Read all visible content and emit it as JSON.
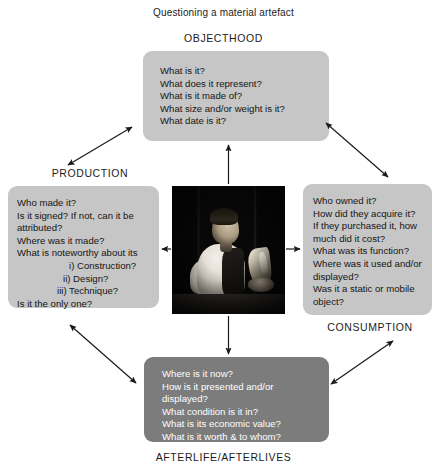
{
  "diagram": {
    "title": "Questioning a material artefact",
    "centre_image_alt": "photograph of a person examining an object",
    "colors": {
      "box_light": "#c6c6c6",
      "box_dark": "#7c7c7c",
      "text_dark": "#151515",
      "text_light": "#ffffff",
      "arrow": "#1a1a1a",
      "background": "#ffffff"
    },
    "nodes": {
      "objecthood": {
        "label": "OBJECTHOOD",
        "questions": [
          "What is it?",
          "What does it represent?",
          "What is it made of?",
          "What size and/or weight is it?",
          "What date is it?"
        ]
      },
      "production": {
        "label": "PRODUCTION",
        "questions": [
          "Who made it?",
          "Is it signed? If not, can it be",
          "attributed?",
          "Where was it made?",
          "What is noteworthy about its",
          "i) Construction?",
          "ii) Design?",
          "iii) Technique?",
          "Is it the only one?"
        ]
      },
      "consumption": {
        "label": "CONSUMPTION",
        "questions": [
          "Who owned it?",
          "How did they acquire it?",
          "If they purchased it, how",
          "much did it cost?",
          "What was its function?",
          "Where was it used and/or",
          "displayed?",
          "Was it a static or mobile",
          "object?"
        ]
      },
      "afterlife": {
        "label": "AFTERLIFE/AFTERLIVES",
        "questions": [
          "Where is it now?",
          "How is it presented and/or",
          "displayed?",
          "What condition is it in?",
          "What is its economic value?",
          "What is it worth & to whom?"
        ]
      }
    },
    "connectors": [
      {
        "name": "centre-to-objecthood",
        "from": "centre",
        "to": "objecthood",
        "heads": "single-up"
      },
      {
        "name": "centre-to-production",
        "from": "centre",
        "to": "production",
        "heads": "single-left"
      },
      {
        "name": "centre-to-consumption",
        "from": "centre",
        "to": "consumption",
        "heads": "single-right"
      },
      {
        "name": "centre-to-afterlife",
        "from": "centre",
        "to": "afterlife",
        "heads": "single-down"
      },
      {
        "name": "production-to-objecthood",
        "from": "production",
        "to": "objecthood",
        "heads": "double"
      },
      {
        "name": "objecthood-to-consumption",
        "from": "objecthood",
        "to": "consumption",
        "heads": "double"
      },
      {
        "name": "production-to-afterlife",
        "from": "production",
        "to": "afterlife",
        "heads": "double"
      },
      {
        "name": "afterlife-to-consumption",
        "from": "afterlife",
        "to": "consumption",
        "heads": "double"
      }
    ]
  }
}
